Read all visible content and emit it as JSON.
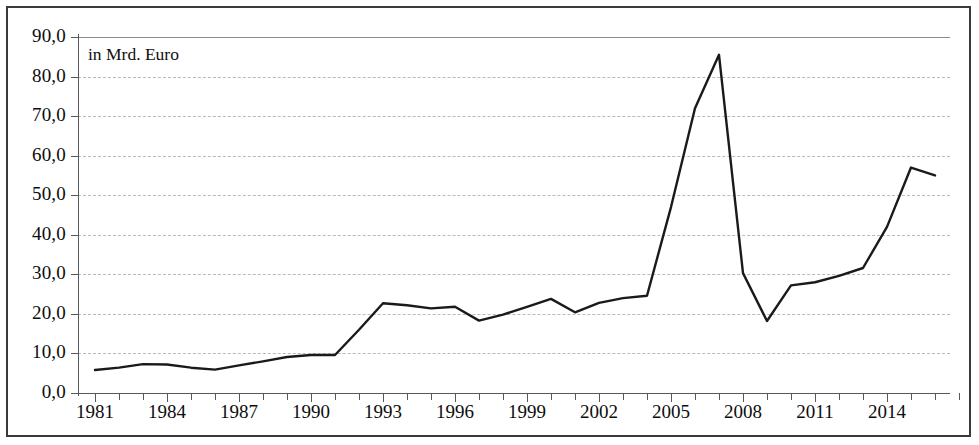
{
  "chart_data": {
    "type": "line",
    "title": "",
    "subtitle": "",
    "annotation": "in Mrd. Euro",
    "xlabel": "",
    "ylabel": "",
    "xlim": [
      1981,
      2017
    ],
    "ylim": [
      0,
      90
    ],
    "grid": true,
    "legend_position": "none",
    "y_tick_labels": [
      "90,0",
      "80,0",
      "70,0",
      "60,0",
      "50,0",
      "40,0",
      "30,0",
      "20,0",
      "10,0",
      "0,0"
    ],
    "y_tick_values": [
      90,
      80,
      70,
      60,
      50,
      40,
      30,
      20,
      10,
      0
    ],
    "x_tick_labels": [
      "1981",
      "1984",
      "1987",
      "1990",
      "1993",
      "1996",
      "1999",
      "2002",
      "2005",
      "2008",
      "2011",
      "2014"
    ],
    "x_tick_values": [
      1981,
      1984,
      1987,
      1990,
      1993,
      1996,
      1999,
      2002,
      2005,
      2008,
      2011,
      2014
    ],
    "x_minor_tick_step": 1,
    "line_color": "#1a1a1a",
    "line_width": 2.4,
    "x": [
      1981,
      1982,
      1983,
      1984,
      1985,
      1986,
      1987,
      1988,
      1989,
      1990,
      1991,
      1992,
      1993,
      1994,
      1995,
      1996,
      1997,
      1998,
      1999,
      2000,
      2001,
      2002,
      2003,
      2004,
      2005,
      2006,
      2007,
      2008,
      2009,
      2010,
      2011,
      2012,
      2013,
      2014,
      2015,
      2016
    ],
    "values": [
      5.8,
      6.4,
      7.3,
      7.2,
      6.4,
      5.9,
      7.0,
      8.0,
      9.1,
      9.6,
      9.6,
      16.0,
      22.7,
      22.2,
      21.4,
      21.8,
      18.3,
      19.8,
      21.8,
      23.8,
      20.4,
      22.8,
      24.0,
      24.6,
      47.0,
      72.0,
      85.5,
      30.3,
      18.2,
      27.2,
      28.0,
      29.6,
      31.6,
      42.0,
      57.0,
      55.0
    ],
    "series": [
      {
        "name": "",
        "values": [
          5.8,
          6.4,
          7.3,
          7.2,
          6.4,
          5.9,
          7.0,
          8.0,
          9.1,
          9.6,
          9.6,
          16.0,
          22.7,
          22.2,
          21.4,
          21.8,
          18.3,
          19.8,
          21.8,
          23.8,
          20.4,
          22.8,
          24.0,
          24.6,
          47.0,
          72.0,
          85.5,
          30.3,
          18.2,
          27.2,
          28.0,
          29.6,
          31.6,
          42.0,
          57.0,
          55.0
        ]
      }
    ]
  },
  "colors": {
    "line": "#1a1a1a",
    "grid": "#b9b9b9",
    "axis": "#58585a",
    "frame": "#3a3a3a",
    "background": "#ffffff",
    "text": "#0d0d0d"
  }
}
